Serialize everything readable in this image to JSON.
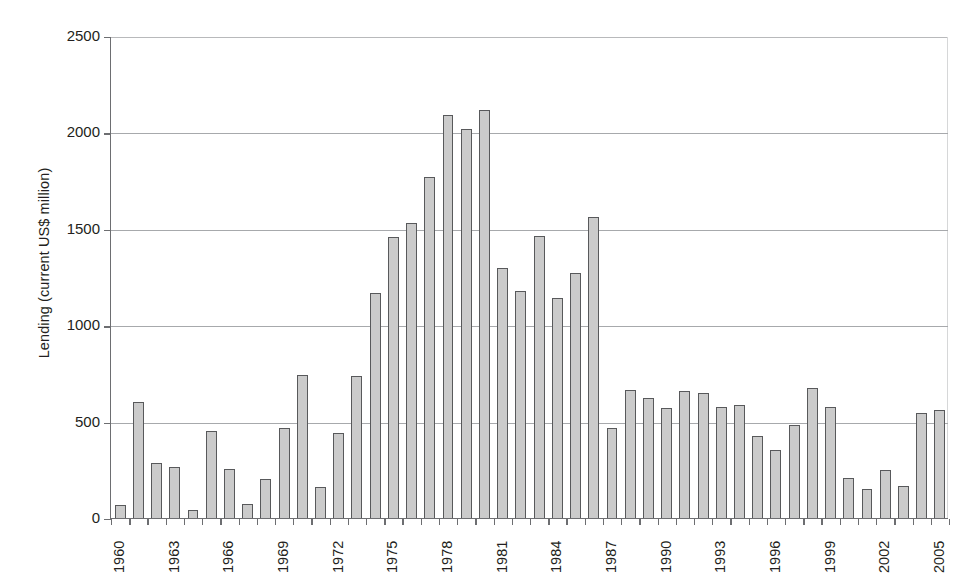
{
  "chart_data": {
    "type": "bar",
    "title": "",
    "xlabel": "",
    "ylabel": "Lending (current US$ million)",
    "ylim": [
      0,
      2500
    ],
    "ytick_values": [
      0,
      500,
      1000,
      1500,
      2000,
      2500
    ],
    "ytick_labels": [
      "0",
      "500",
      "1000",
      "1500",
      "2000",
      "2500"
    ],
    "grid": "horizontal",
    "legend": "none",
    "xtick_labels": [
      "1960",
      "1963",
      "1966",
      "1969",
      "1972",
      "1975",
      "1978",
      "1981",
      "1984",
      "1987",
      "1990",
      "1993",
      "1996",
      "1999",
      "2002",
      "2005"
    ],
    "xtick_step": 3,
    "categories": [
      "1960",
      "1961",
      "1962",
      "1963",
      "1964",
      "1965",
      "1966",
      "1967",
      "1968",
      "1969",
      "1970",
      "1971",
      "1972",
      "1973",
      "1974",
      "1975",
      "1976",
      "1977",
      "1978",
      "1979",
      "1980",
      "1981",
      "1982",
      "1983",
      "1984",
      "1985",
      "1986",
      "1987",
      "1988",
      "1989",
      "1990",
      "1991",
      "1992",
      "1993",
      "1994",
      "1995",
      "1996",
      "1997",
      "1998",
      "1999",
      "2000",
      "2001",
      "2002",
      "2003",
      "2004",
      "2005"
    ],
    "values": [
      70,
      600,
      285,
      265,
      40,
      450,
      255,
      75,
      200,
      465,
      740,
      160,
      440,
      735,
      1165,
      1460,
      1530,
      1770,
      2090,
      2020,
      2115,
      1295,
      1175,
      1465,
      1140,
      1270,
      1560,
      465,
      665,
      625,
      570,
      660,
      650,
      575,
      585,
      425,
      355,
      485,
      675,
      575,
      205,
      150,
      250,
      165,
      545,
      560
    ],
    "bar_fill_color": "#cbcbcb",
    "bar_edge_color": "#58595b",
    "axis_color": "#6d6e71",
    "grid_color": "#a7a9ac",
    "text_color": "#231f20",
    "background_color": "#ffffff"
  }
}
